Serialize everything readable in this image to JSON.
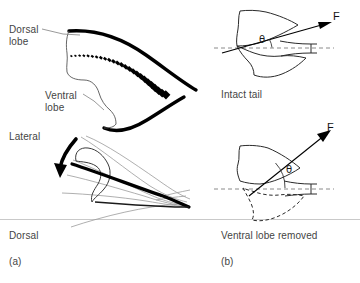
{
  "figure": {
    "width": 360,
    "height": 283,
    "background": "#ffffff"
  },
  "panels": {
    "a": {
      "caption": "(a)",
      "views": {
        "lateral": "Lateral",
        "dorsal": "Dorsal"
      },
      "annotations": {
        "dorsal_lobe": "Dorsal\nlobe",
        "ventral_lobe": "Ventral\nlobe"
      }
    },
    "b": {
      "caption": "(b)",
      "top": {
        "caption": "Intact tail",
        "force_label": "F",
        "angle_label": "θ",
        "angle_degrees": 16
      },
      "bottom": {
        "caption": "Ventral lobe removed",
        "force_label": "F",
        "angle_label": "θ",
        "angle_degrees": 47
      }
    }
  },
  "colors": {
    "ink": "#000000",
    "text": "#444444",
    "thin_line": "#6e6e6e",
    "faint_line": "#9a9a9a",
    "divider": "#c9c9c9",
    "dashed_axis": "#8a8a8a"
  }
}
